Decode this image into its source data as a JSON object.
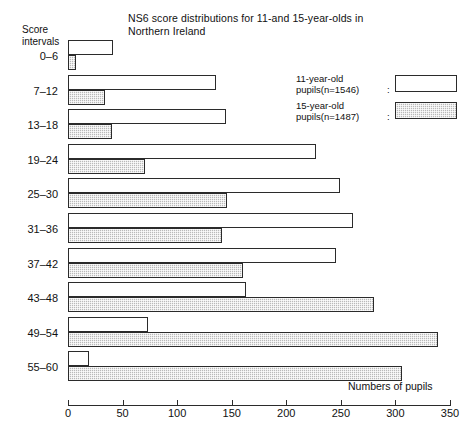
{
  "chart_data": {
    "type": "bar",
    "orientation": "horizontal",
    "title": "NS6 score distributions for 11-and 15-year-olds in Northern Ireland",
    "title_line1": "NS6 score distributions for 11-and 15-year-olds in",
    "title_line2": "Northern Ireland",
    "ylabel_line1": "Score",
    "ylabel_line2": "intervals",
    "xlabel": "Numbers of pupils",
    "xlim": [
      0,
      350
    ],
    "xticks": [
      0,
      50,
      100,
      150,
      200,
      250,
      300,
      350
    ],
    "xtick_labels": [
      "0",
      "50",
      "100",
      "150",
      "200",
      "250",
      "300",
      "350"
    ],
    "grid": false,
    "legend_position": "top-right",
    "categories": [
      "0–6",
      "7–12",
      "13–18",
      "19–24",
      "25–30",
      "31–36",
      "37–42",
      "43–48",
      "49–54",
      "55–60"
    ],
    "series": [
      {
        "name": "11-year-old pupils (n=1546)",
        "legend_line1": "11-year-old",
        "legend_line2": "pupils(n=1546)",
        "swatch": "white",
        "values": [
          41,
          136,
          145,
          227,
          249,
          261,
          246,
          163,
          73,
          19
        ]
      },
      {
        "name": "15-year-old pupils (n=1487)",
        "legend_line1": "15-year-old",
        "legend_line2": "pupils(n=1487)",
        "swatch": "hatched",
        "values": [
          7,
          34,
          40,
          71,
          146,
          141,
          160,
          280,
          339,
          306
        ]
      }
    ]
  },
  "legend": {
    "colon": ":"
  },
  "colors": {
    "axis": "#2b2b2b",
    "bar_11": "#ffffff",
    "bar_15": "#b9b9b9",
    "text": "#111111"
  }
}
